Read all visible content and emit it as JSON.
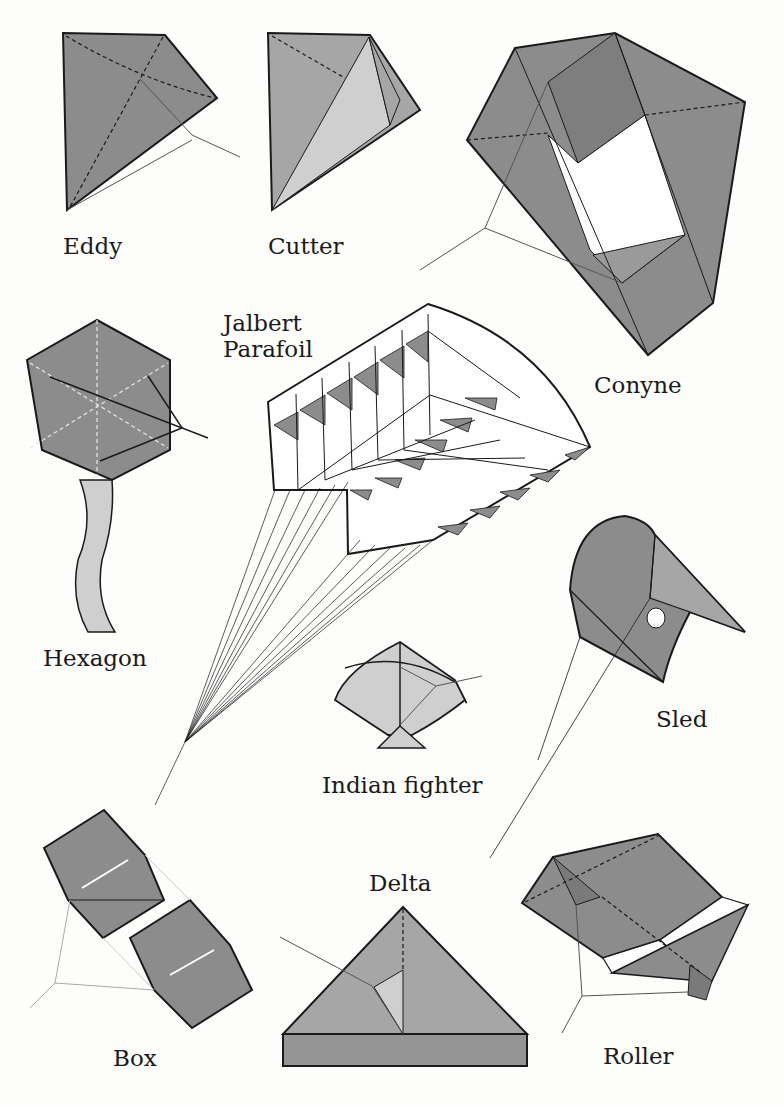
{
  "colors": {
    "dark_fill": "#8c8c8c",
    "mid_fill": "#a6a6a6",
    "light_fill": "#cfcfcf",
    "outline": "#1a1a1a",
    "line": "#555555",
    "background": "#fdfdfc"
  },
  "kites": [
    {
      "id": "eddy",
      "label": "Eddy"
    },
    {
      "id": "cutter",
      "label": "Cutter"
    },
    {
      "id": "conyne",
      "label": "Conyne"
    },
    {
      "id": "hexagon",
      "label": "Hexagon"
    },
    {
      "id": "jalbert",
      "label": "Jalbert\nParafoil"
    },
    {
      "id": "indian",
      "label": "Indian fighter"
    },
    {
      "id": "sled",
      "label": "Sled"
    },
    {
      "id": "box",
      "label": "Box"
    },
    {
      "id": "delta",
      "label": "Delta"
    },
    {
      "id": "roller",
      "label": "Roller"
    }
  ]
}
